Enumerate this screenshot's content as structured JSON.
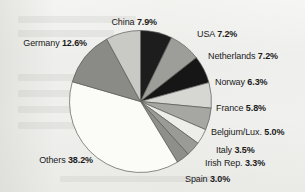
{
  "figure": {
    "background_color": "#f0f0ee",
    "outline_color": "#5a5a58"
  },
  "chart_data": {
    "type": "pie",
    "title": "",
    "subtitle": "",
    "xlabel": "",
    "ylabel": "",
    "units": "percent",
    "legend_position": "callout-labels",
    "grid": false,
    "start_angle_deg": 0,
    "direction": "clockwise",
    "categories": [
      "USA",
      "Netherlands",
      "Norway",
      "France",
      "Belgium/Lux.",
      "Italy",
      "Irish Rep.",
      "Spain",
      "Others",
      "Germany",
      "China"
    ],
    "values": [
      7.2,
      7.2,
      6.3,
      5.8,
      5.0,
      3.5,
      3.3,
      3.0,
      38.2,
      12.6,
      7.9
    ],
    "value_labels": [
      "7.2%",
      "7.2%",
      "6.3%",
      "5.8%",
      "5.0%",
      "3.5%",
      "3.3%",
      "3.0%",
      "38.2%",
      "12.6%",
      "7.9%"
    ],
    "slice_colors": [
      "#1d1d1d",
      "#9d9d9a",
      "#161616",
      "#d6d6d2",
      "#a6a6a2",
      "#ededea",
      "#9a9a96",
      "#8e8e8a",
      "#fbfbf8",
      "#8a8a86",
      "#c9c9c5"
    ],
    "slices": [
      {
        "name": "USA",
        "value": 7.2,
        "label": "USA 7.2%",
        "color": "#1d1d1d"
      },
      {
        "name": "Netherlands",
        "value": 7.2,
        "label": "Netherlands 7.2%",
        "color": "#9d9d9a"
      },
      {
        "name": "Norway",
        "value": 6.3,
        "label": "Norway 6.3%",
        "color": "#161616"
      },
      {
        "name": "France",
        "value": 5.8,
        "label": "France 5.8%",
        "color": "#d6d6d2"
      },
      {
        "name": "Belgium/Lux.",
        "value": 5.0,
        "label": "Belgium/Lux. 5.0%",
        "color": "#a6a6a2"
      },
      {
        "name": "Italy",
        "value": 3.5,
        "label": "Italy 3.5%",
        "color": "#ededea"
      },
      {
        "name": "Irish Rep.",
        "value": 3.3,
        "label": "Irish Rep. 3.3%",
        "color": "#9a9a96"
      },
      {
        "name": "Spain",
        "value": 3.0,
        "label": "Spain 3.0%",
        "color": "#8e8e8a"
      },
      {
        "name": "Others",
        "value": 38.2,
        "label": "Others 38.2%",
        "color": "#fbfbf8"
      },
      {
        "name": "Germany",
        "value": 12.6,
        "label": "Germany 12.6%",
        "color": "#8a8a86"
      },
      {
        "name": "China",
        "value": 7.9,
        "label": "China 7.9%",
        "color": "#c9c9c5"
      }
    ]
  },
  "labels": {
    "usa": {
      "name": "USA",
      "pct": "7.2%"
    },
    "netherlands": {
      "name": "Netherlands",
      "pct": "7.2%"
    },
    "norway": {
      "name": "Norway",
      "pct": "6.3%"
    },
    "france": {
      "name": "France",
      "pct": "5.8%"
    },
    "belgium": {
      "name": "Belgium/Lux.",
      "pct": "5.0%"
    },
    "italy": {
      "name": "Italy",
      "pct": "3.5%"
    },
    "ireland": {
      "name": "Irish Rep.",
      "pct": "3.3%"
    },
    "spain": {
      "name": "Spain",
      "pct": "3.0%"
    },
    "others": {
      "name": "Others",
      "pct": "38.2%"
    },
    "germany": {
      "name": "Germany",
      "pct": "12.6%"
    },
    "china": {
      "name": "China",
      "pct": "7.9%"
    }
  }
}
